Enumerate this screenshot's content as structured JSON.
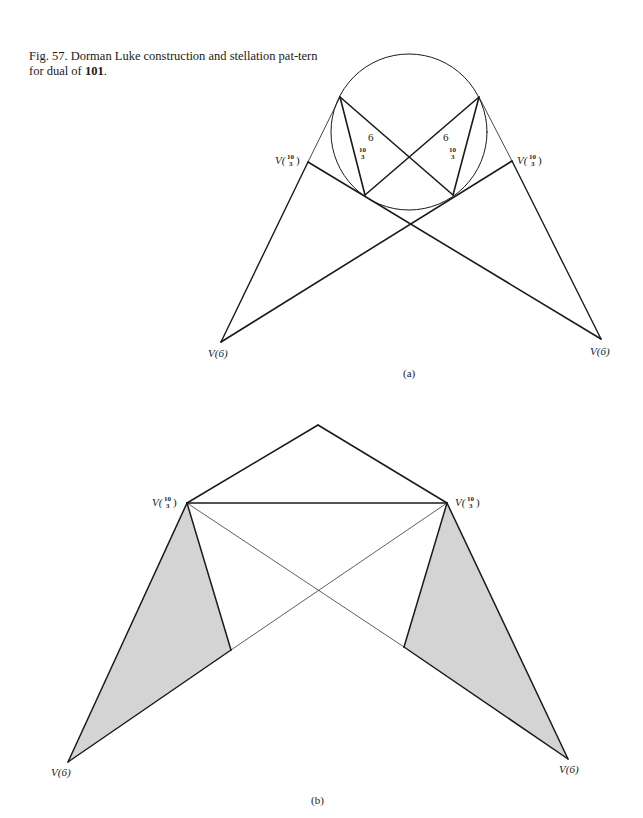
{
  "caption": {
    "prefix": "Fig. 57. Dorman Luke construction and stellation pat-tern for dual of ",
    "bold_ref": "101",
    "suffix": "."
  },
  "figure_a": {
    "label": "(a)",
    "vertex_labels": {
      "left_upper": {
        "v": "V(",
        "num": "10",
        "den": "3",
        "close": ")"
      },
      "right_upper": {
        "v": "V(",
        "num": "10",
        "den": "3",
        "close": ")"
      },
      "left_lower": "V(6)",
      "right_lower": "V(6)"
    },
    "angle_labels": {
      "left_six": "6",
      "right_six": "6",
      "left_frac_num": "10",
      "left_frac_den": "3",
      "right_frac_num": "10",
      "right_frac_den": "3"
    },
    "circle": {
      "cx": 409,
      "cy": 132,
      "r": 78
    }
  },
  "figure_b": {
    "label": "(b)",
    "vertex_labels": {
      "left_upper": {
        "v": "V(",
        "num": "10",
        "den": "3",
        "close": ")"
      },
      "right_upper": {
        "v": "V(",
        "num": "10",
        "den": "3",
        "close": ")"
      },
      "left_lower": "V(6)",
      "right_lower": "V(6)"
    },
    "shade_color": "#d4d4d4"
  },
  "colors": {
    "line": "#1a1a1a",
    "background": "#ffffff"
  }
}
